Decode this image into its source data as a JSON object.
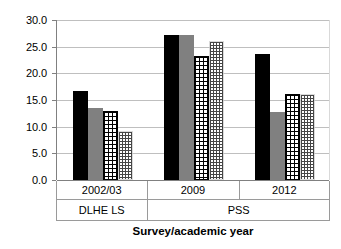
{
  "chart_data": {
    "type": "bar",
    "title": "",
    "subtitle": "",
    "xlabel": "Survey/academic year",
    "ylabel": "",
    "ylim": [
      0.0,
      30.0
    ],
    "ytick_step": 5.0,
    "ytick_labels": [
      "0.0",
      "5.0",
      "10.0",
      "15.0",
      "20.0",
      "25.0",
      "30.0"
    ],
    "ytick_values": [
      0.0,
      5.0,
      10.0,
      15.0,
      20.0,
      25.0,
      30.0
    ],
    "grid": true,
    "legend": false,
    "legend_position": "none",
    "categories": [
      "2002/03",
      "2009",
      "2012"
    ],
    "group_labels": [
      "DLHE LS",
      "PSS"
    ],
    "group_spans": [
      1,
      2
    ],
    "series": [
      {
        "name": "series-1",
        "pattern": "solid-black",
        "color": "#000000",
        "values": [
          16.7,
          27.1,
          23.7
        ]
      },
      {
        "name": "series-2",
        "pattern": "solid-grey",
        "color": "#808080",
        "values": [
          13.5,
          27.1,
          12.7
        ]
      },
      {
        "name": "series-3",
        "pattern": "crosshatch-grid",
        "color": "#000000",
        "values": [
          12.9,
          23.2,
          16.1
        ]
      },
      {
        "name": "series-4",
        "pattern": "fine-dotted",
        "color": "#9a9a9a",
        "values": [
          9.2,
          26.0,
          16.1
        ]
      }
    ]
  },
  "axis": {
    "x_title": "Survey/academic year"
  },
  "colors": {
    "series_1": "#000000",
    "series_2": "#808080",
    "gridline": "#bfbfbf",
    "axis": "#808080",
    "background": "#ffffff"
  }
}
